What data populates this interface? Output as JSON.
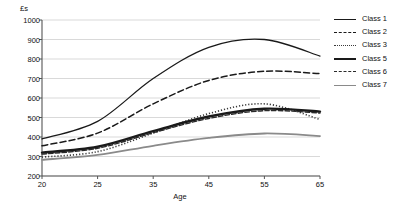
{
  "chart_data": {
    "type": "line",
    "title": "",
    "xlabel": "Age",
    "ylabel": "£s",
    "ylim": [
      200,
      1000
    ],
    "ytick_step": 100,
    "grid": true,
    "legend_position": "right",
    "x_tick_labels": [
      "20",
      "25",
      "35",
      "45",
      "55",
      "65"
    ],
    "y_tick_labels": [
      "1000",
      "900",
      "800",
      "700",
      "600",
      "500",
      "400",
      "300",
      "200"
    ],
    "x": [
      20,
      25,
      35,
      45,
      55,
      65
    ],
    "series": [
      {
        "name": "Class 1",
        "style": "solid",
        "color": "#1a1a1a",
        "width": 1.3,
        "values": [
          390,
          480,
          700,
          860,
          900,
          815
        ]
      },
      {
        "name": "Class 2",
        "style": "dashed",
        "color": "#1a1a1a",
        "width": 1.5,
        "values": [
          355,
          420,
          570,
          690,
          737,
          725
        ]
      },
      {
        "name": "Class 3",
        "style": "dotted",
        "color": "#3a3a3a",
        "width": 1.6,
        "values": [
          297,
          325,
          420,
          520,
          570,
          490
        ]
      },
      {
        "name": "Class 5",
        "style": "thick-solid",
        "color": "#1a1a1a",
        "width": 2.4,
        "values": [
          320,
          350,
          430,
          505,
          545,
          530
        ]
      },
      {
        "name": "Class 6",
        "style": "dash-dot",
        "color": "#2a2a2a",
        "width": 1.4,
        "values": [
          312,
          342,
          422,
          495,
          535,
          523
        ]
      },
      {
        "name": "Class 7",
        "style": "gray-solid",
        "color": "#8a8a8a",
        "width": 1.8,
        "values": [
          283,
          308,
          355,
          395,
          418,
          405
        ]
      }
    ]
  },
  "legend": {
    "items": [
      {
        "label": "Class 1"
      },
      {
        "label": "Class 2"
      },
      {
        "label": "Class 3"
      },
      {
        "label": "Class 5"
      },
      {
        "label": "Class 6"
      },
      {
        "label": "Class 7"
      }
    ]
  },
  "axes": {
    "y_unit_label": "£s",
    "x_axis_label": "Age"
  }
}
